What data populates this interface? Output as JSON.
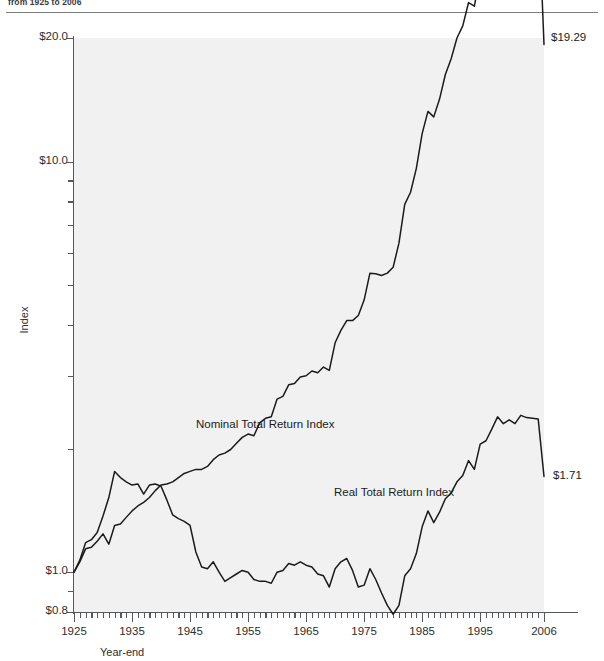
{
  "figure": {
    "subtitle": "from 1925 to 2006"
  },
  "chart_data": {
    "type": "line",
    "title": "",
    "xlabel": "Year-end",
    "ylabel": "Index",
    "yscale": "log",
    "ylim": [
      0.8,
      20.0
    ],
    "xlim": [
      1925,
      2006
    ],
    "grid": false,
    "legend_position": "inline-annotations",
    "y_tick_labels": [
      "$20.0",
      "$10.0",
      "$1.0",
      "$0.8"
    ],
    "y_tick_values": [
      20.0,
      10.0,
      1.0,
      0.8
    ],
    "y_minor_ticks": [
      9,
      8,
      7,
      6,
      5,
      4,
      3,
      2,
      0.9
    ],
    "x_tick_labels": [
      "1925",
      "1935",
      "1945",
      "1955",
      "1965",
      "1975",
      "1985",
      "1995",
      "2006"
    ],
    "x_tick_values": [
      1925,
      1935,
      1945,
      1955,
      1965,
      1975,
      1985,
      1995,
      2006
    ],
    "annotations": [
      {
        "name": "nominal-end-value",
        "text": "$19.29",
        "x": 2006,
        "y": 19.29
      },
      {
        "name": "real-end-value",
        "text": "$1.71",
        "x": 2006,
        "y": 1.71
      }
    ],
    "series": [
      {
        "name": "Nominal Total Return Index",
        "label": "Nominal Total Return Index",
        "color": "#1b1b1b",
        "x": [
          1925,
          1926,
          1927,
          1928,
          1929,
          1930,
          1931,
          1932,
          1933,
          1934,
          1935,
          1936,
          1937,
          1938,
          1939,
          1940,
          1941,
          1942,
          1943,
          1944,
          1945,
          1946,
          1947,
          1948,
          1949,
          1950,
          1951,
          1952,
          1953,
          1954,
          1955,
          1956,
          1957,
          1958,
          1959,
          1960,
          1961,
          1962,
          1963,
          1964,
          1965,
          1966,
          1967,
          1968,
          1969,
          1970,
          1971,
          1972,
          1973,
          1974,
          1975,
          1976,
          1977,
          1978,
          1979,
          1980,
          1981,
          1982,
          1983,
          1984,
          1985,
          1986,
          1987,
          1988,
          1989,
          1990,
          1991,
          1992,
          1993,
          1994,
          1995,
          1996,
          1997,
          1998,
          1999,
          2000,
          2001,
          2002,
          2003,
          2004,
          2005,
          2006
        ],
        "values": [
          1.0,
          1.06,
          1.14,
          1.15,
          1.19,
          1.24,
          1.17,
          1.3,
          1.31,
          1.36,
          1.41,
          1.45,
          1.48,
          1.52,
          1.58,
          1.63,
          1.64,
          1.66,
          1.7,
          1.74,
          1.76,
          1.78,
          1.78,
          1.81,
          1.88,
          1.93,
          1.95,
          1.99,
          2.06,
          2.13,
          2.17,
          2.15,
          2.31,
          2.37,
          2.39,
          2.64,
          2.68,
          2.86,
          2.88,
          2.99,
          3.01,
          3.09,
          3.06,
          3.16,
          3.1,
          3.62,
          3.88,
          4.1,
          4.1,
          4.22,
          4.6,
          5.35,
          5.33,
          5.28,
          5.35,
          5.53,
          6.33,
          7.87,
          8.42,
          9.63,
          11.7,
          13.25,
          12.85,
          14.2,
          16.3,
          17.8,
          20.0,
          21.4,
          24.4,
          23.9,
          28.7,
          30.2,
          33.1,
          36.4,
          35.9,
          37.8,
          38.0,
          40.6,
          41.2,
          42.2,
          43.6,
          19.29
        ],
        "note": "monotone-ish nominal bond/asset total return index rising from $1.00 (1925) to $19.29 (2006) on a log scale"
      },
      {
        "name": "Real Total Return Index",
        "label": "Real Total Return Index",
        "color": "#1b1b1b",
        "x": [
          1925,
          1926,
          1927,
          1928,
          1929,
          1930,
          1931,
          1932,
          1933,
          1934,
          1935,
          1936,
          1937,
          1938,
          1939,
          1940,
          1941,
          1942,
          1943,
          1944,
          1945,
          1946,
          1947,
          1948,
          1949,
          1950,
          1951,
          1952,
          1953,
          1954,
          1955,
          1956,
          1957,
          1958,
          1959,
          1960,
          1961,
          1962,
          1963,
          1964,
          1965,
          1966,
          1967,
          1968,
          1969,
          1970,
          1971,
          1972,
          1973,
          1974,
          1975,
          1976,
          1977,
          1978,
          1979,
          1980,
          1981,
          1982,
          1983,
          1984,
          1985,
          1986,
          1987,
          1988,
          1989,
          1990,
          1991,
          1992,
          1993,
          1994,
          1995,
          1996,
          1997,
          1998,
          1999,
          2000,
          2001,
          2002,
          2003,
          2004,
          2005,
          2006
        ],
        "values": [
          1.0,
          1.07,
          1.18,
          1.2,
          1.25,
          1.37,
          1.52,
          1.76,
          1.7,
          1.66,
          1.63,
          1.64,
          1.55,
          1.63,
          1.64,
          1.62,
          1.5,
          1.38,
          1.35,
          1.33,
          1.3,
          1.12,
          1.03,
          1.02,
          1.06,
          1.0,
          0.95,
          0.97,
          0.99,
          1.01,
          1.0,
          0.96,
          0.95,
          0.95,
          0.94,
          1.0,
          1.01,
          1.05,
          1.04,
          1.06,
          1.04,
          1.03,
          0.99,
          0.98,
          0.92,
          1.02,
          1.06,
          1.08,
          1.01,
          0.92,
          0.93,
          1.02,
          0.96,
          0.89,
          0.83,
          0.79,
          0.83,
          0.98,
          1.02,
          1.11,
          1.29,
          1.41,
          1.32,
          1.4,
          1.51,
          1.56,
          1.66,
          1.72,
          1.87,
          1.78,
          2.05,
          2.09,
          2.23,
          2.39,
          2.3,
          2.35,
          2.3,
          2.41,
          2.38,
          2.37,
          2.36,
          1.71
        ],
        "note": "inflation-adjusted index: peaks ~1.8 in 1933, collapses after 1946, troughs ~0.8 in 1981, recovers to $1.71 by 2006"
      }
    ]
  }
}
